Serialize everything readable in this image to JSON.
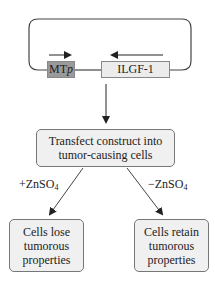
{
  "plasmid": {
    "promoter_label": "MT",
    "promoter_suffix": "p",
    "gene_label": "ILGF-1",
    "promoter_color": "#9a9a9a",
    "gene_color": "#ececec"
  },
  "step": {
    "line1": "Transfect construct into",
    "line2": "tumor-causing cells"
  },
  "branches": {
    "left_prefix": "+ZnSO",
    "left_sub": "4",
    "right_prefix": "−ZnSO",
    "right_sub": "4"
  },
  "outcomes": {
    "left": {
      "line1": "Cells lose",
      "line2": "tumorous",
      "line3": "properties"
    },
    "right": {
      "line1": "Cells retain",
      "line2": "tumorous",
      "line3": "properties"
    }
  }
}
